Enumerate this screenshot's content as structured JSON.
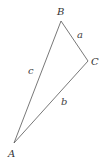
{
  "diagram": {
    "type": "triangle",
    "stroke_color": "#555555",
    "vertices": [
      {
        "label": "A",
        "x": 14,
        "y": 143,
        "label_x": 8,
        "label_y": 157
      },
      {
        "label": "B",
        "x": 61,
        "y": 21,
        "label_x": 57,
        "label_y": 15
      },
      {
        "label": "C",
        "x": 88,
        "y": 61,
        "label_x": 91,
        "label_y": 65
      }
    ],
    "sides": [
      {
        "label": "a",
        "from": "B",
        "to": "C",
        "label_x": 77,
        "label_y": 38
      },
      {
        "label": "b",
        "from": "C",
        "to": "A",
        "label_x": 61,
        "label_y": 105
      },
      {
        "label": "c",
        "from": "A",
        "to": "B",
        "label_x": 28,
        "label_y": 74
      }
    ]
  }
}
